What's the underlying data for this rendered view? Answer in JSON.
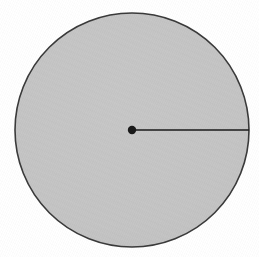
{
  "figure": {
    "type": "geometry-diagram",
    "caption": "",
    "background_color": "#ffffff",
    "canvas": {
      "width": 259,
      "height": 257
    }
  },
  "circle": {
    "name": "circle",
    "center_x": 132,
    "center_y": 130,
    "radius": 117,
    "fill_color": "#c5c5c5",
    "stroke_color": "#3a3a3a",
    "stroke_width": 1.6,
    "label": ""
  },
  "center_point": {
    "name": "center-point",
    "x": 132,
    "y": 130,
    "radius": 4.2,
    "color": "#1a1a1a",
    "label": ""
  },
  "radius_segment": {
    "name": "radius-segment",
    "x1": 132,
    "y1": 130,
    "x2": 249,
    "y2": 130,
    "color": "#1a1a1a",
    "stroke_width": 1.6,
    "label": ""
  },
  "annotations": []
}
